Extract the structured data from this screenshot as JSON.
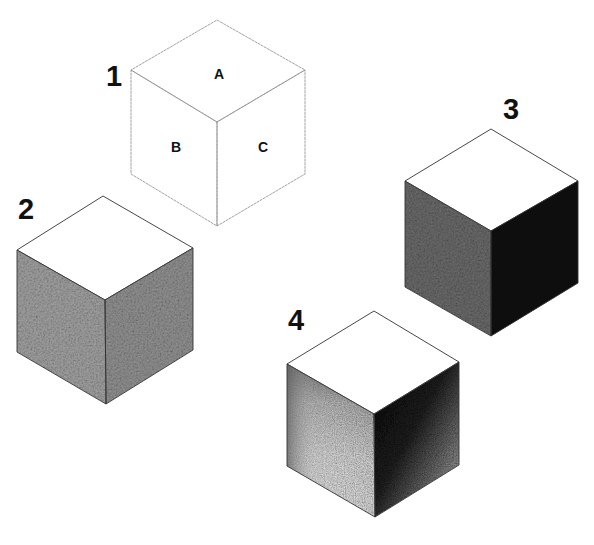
{
  "figure": {
    "background": "#ffffff"
  },
  "cubes": [
    {
      "label": "1",
      "shading": "outline-only",
      "faces": {
        "top": "A",
        "left": "B",
        "right": "C"
      },
      "colors": {
        "top": "#ffffff",
        "left": "#ffffff",
        "right": "#ffffff"
      }
    },
    {
      "label": "2",
      "shading": "even-midtone",
      "faces": {
        "top": "",
        "left": "",
        "right": ""
      },
      "colors": {
        "top": "#ffffff",
        "left": "#8f8f8f",
        "right": "#7d7d7d"
      }
    },
    {
      "label": "3",
      "shading": "light-top-dark-sides",
      "faces": {
        "top": "",
        "left": "",
        "right": ""
      },
      "colors": {
        "top": "#ffffff",
        "left": "#5a5a5a",
        "right": "#0e0e0e"
      }
    },
    {
      "label": "4",
      "shading": "graduated",
      "faces": {
        "top": "",
        "left": "",
        "right": ""
      },
      "colors": {
        "top": "#ffffff",
        "left": "#e6e6e6",
        "right": "#2a2a2a"
      }
    }
  ]
}
